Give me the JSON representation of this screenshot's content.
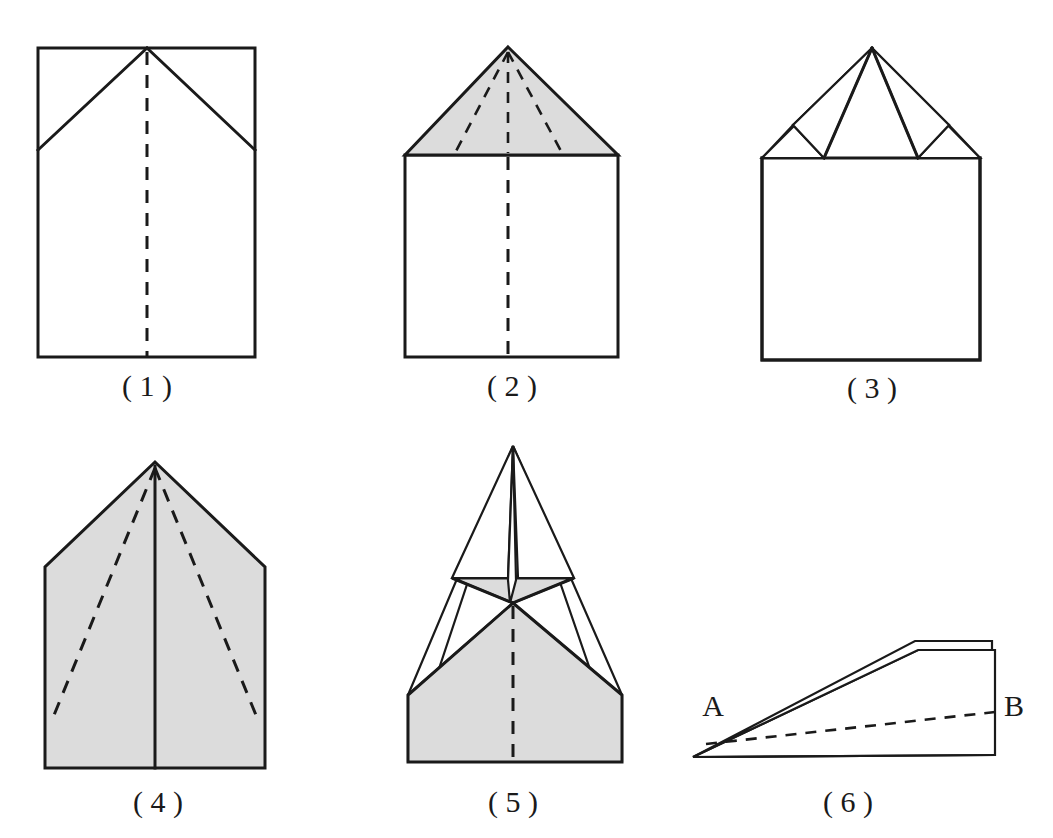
{
  "figure": {
    "background_color": "#ffffff",
    "line_color": "#1a1a1a",
    "shade_color": "#dcdcdc",
    "panel_count": 6
  },
  "panels": [
    {
      "id": "panel-1",
      "caption": "( 1 )",
      "caption_x": 147,
      "caption_y": 396,
      "description": "Rectangle sheet with top corners folded in, dashed vertical center crease",
      "shaded": false
    },
    {
      "id": "panel-2",
      "caption": "( 2 )",
      "caption_x": 512,
      "caption_y": 396,
      "description": "Shaded triangular top flap over rectangle, dashed creases converging at apex",
      "shaded": true
    },
    {
      "id": "panel-3",
      "caption": "( 3 )",
      "caption_x": 872,
      "caption_y": 398,
      "description": "Two narrow flaps folded outward from apex with small shaded triangles at base",
      "shaded": true
    },
    {
      "id": "panel-4",
      "caption": "( 4 )",
      "caption_x": 158,
      "caption_y": 812,
      "description": "Fully shaded pentagon with solid center line and two dashed diagonal creases",
      "shaded": true
    },
    {
      "id": "panel-5",
      "caption": "( 5 )",
      "caption_x": 513,
      "caption_y": 812,
      "description": "Folded dart shape with shaded wings, thin central spike, dashed center crease",
      "shaded": true
    },
    {
      "id": "panel-6",
      "caption": "( 6 )",
      "caption_x": 848,
      "caption_y": 812,
      "description": "Side profile wedge of finished paper plane with dashed interior line",
      "shaded": false
    }
  ],
  "labels": {
    "point_a": "A",
    "point_b": "B",
    "point_a_x": 713,
    "point_a_y": 716,
    "point_b_x": 1014,
    "point_b_y": 716
  }
}
